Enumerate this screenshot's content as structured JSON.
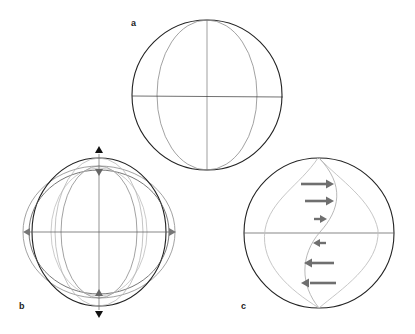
{
  "figure": {
    "panels": [
      {
        "label": "a",
        "description": "Sphere outline with one meridian ellipse and crosshair axes"
      },
      {
        "label": "b",
        "description": "Sphere deformation: vertical compression/extension shown by arrows; overlapping outline ellipses"
      },
      {
        "label": "c",
        "description": "Sphere with sinusoidal (shear) meridian curves and horizontal velocity arrows"
      }
    ],
    "colors": {
      "outline": "#222222",
      "meridian": "#8a8a8a",
      "light_meridian": "#b5b5b5",
      "arrow_gray": "#6f6f6f",
      "arrow_black": "#111111"
    },
    "panel_c_arrows": [
      {
        "direction": "right",
        "length": 32
      },
      {
        "direction": "right",
        "length": 28
      },
      {
        "direction": "right",
        "length": 12
      },
      {
        "direction": "left",
        "length": 12
      },
      {
        "direction": "left",
        "length": 30
      },
      {
        "direction": "left",
        "length": 34
      }
    ]
  }
}
